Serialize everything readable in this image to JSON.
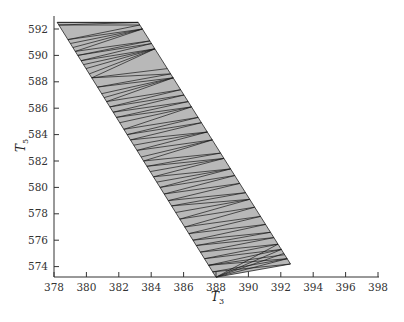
{
  "chart_data": {
    "type": "area",
    "title": "",
    "xlabel": "T3",
    "ylabel": "T5",
    "xlim": [
      378,
      398
    ],
    "ylim": [
      573,
      592.8
    ],
    "xticks": [
      378,
      380,
      382,
      384,
      386,
      388,
      390,
      392,
      394,
      396,
      398
    ],
    "yticks": [
      574,
      576,
      578,
      580,
      582,
      584,
      586,
      588,
      590,
      592
    ],
    "grid": false,
    "legend": null,
    "region": {
      "description": "Feasible region (triangulated polygon) in T3-T5 space",
      "fill": "#b8b8b8",
      "edge_color": "#222222",
      "vertices": [
        {
          "T3": 378.2,
          "T5": 592.5
        },
        {
          "T3": 383.2,
          "T5": 592.5
        },
        {
          "T3": 392.6,
          "T5": 574.2
        },
        {
          "T3": 388.0,
          "T5": 573.2
        }
      ]
    },
    "triangulation": {
      "line_color": "#1a1a1a",
      "left_edge_points_T5": [
        592.5,
        592.3,
        591.2,
        590.9,
        590.6,
        590.3,
        590.0,
        589.6,
        589.3,
        589.0,
        588.6,
        588.3,
        587.6,
        587.1,
        586.8,
        586.5,
        586.1,
        585.7,
        585.3,
        584.9,
        584.4,
        584.0,
        583.6,
        583.2,
        582.8,
        582.3,
        582.0,
        581.6,
        581.2,
        580.8,
        580.4,
        580.0,
        579.5,
        579.0,
        578.6,
        578.1,
        577.6,
        577.0,
        576.5,
        576.0,
        575.6,
        575.1,
        574.6,
        574.1,
        573.6,
        573.2
      ],
      "right_edge_points_T5": [
        592.5,
        592.3,
        592.0,
        591.1,
        590.9,
        590.5,
        589.0,
        588.6,
        588.3,
        587.4,
        587.0,
        586.5,
        586.1,
        585.3,
        584.9,
        584.2,
        583.6,
        582.6,
        582.2,
        581.4,
        580.9,
        580.3,
        579.6,
        579.1,
        578.5,
        577.8,
        577.2,
        576.6,
        576.2,
        575.7,
        575.3,
        574.9,
        574.6,
        574.2
      ]
    }
  }
}
